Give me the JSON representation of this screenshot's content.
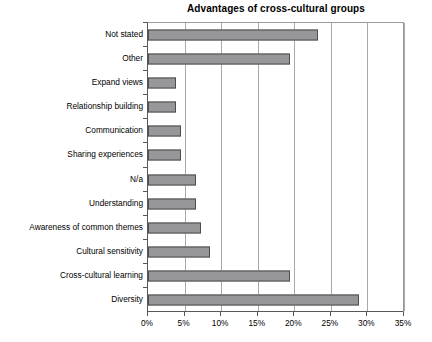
{
  "chart_data": {
    "type": "bar",
    "orientation": "horizontal",
    "title": "Advantages of cross-cultural groups",
    "xlabel": "",
    "ylabel": "",
    "xlim": [
      0,
      35
    ],
    "xtick_labels": [
      "0%",
      "5%",
      "10%",
      "15%",
      "20%",
      "25%",
      "30%",
      "35%"
    ],
    "xtick_values": [
      0,
      5,
      10,
      15,
      20,
      25,
      30,
      35
    ],
    "grid": true,
    "legend": false,
    "units": "percent",
    "categories": [
      "Not stated",
      "Other",
      "Expand views",
      "Relationship building",
      "Communication",
      "Sharing experiences",
      "N/a",
      "Understanding",
      "Awareness of common themes",
      "Cultural sensitivity",
      "Cross-cultural learning",
      "Diversity"
    ],
    "values": [
      23.2,
      19.4,
      3.8,
      3.8,
      4.5,
      4.5,
      6.5,
      6.5,
      7.2,
      8.5,
      19.4,
      28.9
    ],
    "bar_color": "#97979a",
    "bar_edge_color": "#4d4d4f"
  }
}
